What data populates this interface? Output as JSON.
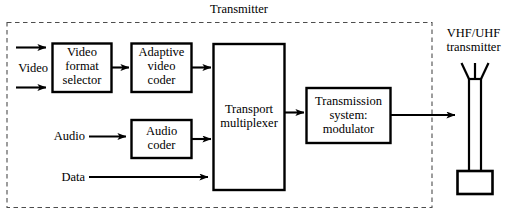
{
  "diagram": {
    "title": "Transmitter",
    "group_boundary": "dashed-region",
    "colors": {
      "line": "#000000",
      "background": "#ffffff",
      "dashed_border": "#666666"
    },
    "blocks": [
      {
        "id": "video_format_selector",
        "label": "Video\nformat\nselector"
      },
      {
        "id": "adaptive_video_coder",
        "label": "Adaptive\nvideo\ncoder"
      },
      {
        "id": "audio_coder",
        "label": "Audio\ncoder"
      },
      {
        "id": "transport_multiplexer",
        "label": "Transport\nmultiplexer"
      },
      {
        "id": "transmission_system_modulator",
        "label": "Transmission\nsystem:\nmodulator"
      }
    ],
    "inputs": [
      {
        "id": "video",
        "label": "Video"
      },
      {
        "id": "audio",
        "label": "Audio"
      },
      {
        "id": "data",
        "label": "Data"
      }
    ],
    "antenna": {
      "id": "vhf_uhf_transmitter",
      "label": "VHF/UHF\ntransmitter"
    }
  }
}
